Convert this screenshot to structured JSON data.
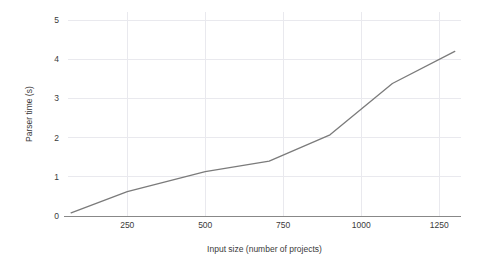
{
  "chart_data": {
    "type": "line",
    "title": "",
    "xlabel": "Input size (number of projects)",
    "ylabel": "Parser time (s)",
    "xlim": [
      60,
      1320
    ],
    "ylim": [
      0,
      5.2
    ],
    "xticks": [
      250,
      500,
      750,
      1000,
      1250
    ],
    "xtick_labels": [
      "250",
      "500",
      "750",
      "1000",
      "1250"
    ],
    "yticks": [
      0,
      1,
      2,
      3,
      4,
      5
    ],
    "ytick_labels": [
      "0",
      "1",
      "2",
      "3",
      "4",
      "5"
    ],
    "grid": true,
    "legend": null,
    "series": [
      {
        "name": "parser time",
        "color": "#7b7b7b",
        "x": [
          70,
          250,
          500,
          705,
          900,
          1100,
          1300
        ],
        "y": [
          0.08,
          0.62,
          1.13,
          1.4,
          2.07,
          3.38,
          4.2
        ]
      }
    ]
  },
  "colors": {
    "line": "#7b7b7b",
    "grid": "#e9e9ee",
    "axis": "#888888",
    "text": "#3a3a3a",
    "background": "#ffffff"
  }
}
